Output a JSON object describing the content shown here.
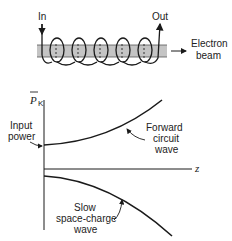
{
  "diagram": {
    "helix": {
      "in_label": "In",
      "out_label": "Out",
      "beam_label_line1": "Electron",
      "beam_label_line2": "beam",
      "turns": 6
    },
    "plot": {
      "y_axis_label": "P",
      "y_axis_subscript": "K",
      "x_axis_label": "z",
      "annotations": {
        "input_power_line1": "Input",
        "input_power_line2": "power",
        "forward_line1": "Forward",
        "forward_line2": "circuit",
        "forward_line3": "wave",
        "slow_line1": "Slow",
        "slow_line2": "space-charge",
        "slow_line3": "wave"
      }
    }
  },
  "colors": {
    "ink": "#1a1a1a",
    "beam_fill": "#bdbdbd"
  }
}
